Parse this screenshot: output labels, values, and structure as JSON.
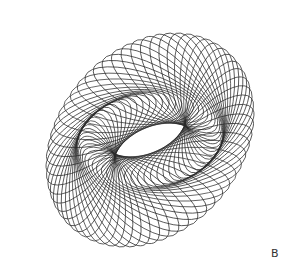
{
  "figure": {
    "panel_label": "B",
    "stroke_color": "#2a2a2a",
    "background": "#ffffff",
    "ellipse_count": 60,
    "center": [
      150,
      140
    ],
    "orbit_radius_x": 68,
    "orbit_radius_y": 42,
    "orbit_tilt_deg": -35,
    "ellipse_rx": 62,
    "ellipse_ry": 22
  }
}
